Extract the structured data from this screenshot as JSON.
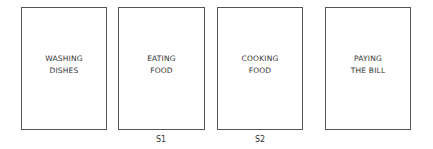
{
  "diagram": {
    "cards": [
      {
        "lines": [
          "WASHING",
          "DISHES"
        ]
      },
      {
        "lines": [
          "EATING",
          "FOOD"
        ]
      },
      {
        "lines": [
          "COOKING",
          "FOOD"
        ]
      },
      {
        "lines": [
          "PAYING",
          "THE BILL"
        ]
      }
    ],
    "labels": [
      "S1",
      "S2"
    ],
    "colors": {
      "border": "#555555",
      "text": "#333333",
      "background": "#ffffff"
    }
  }
}
